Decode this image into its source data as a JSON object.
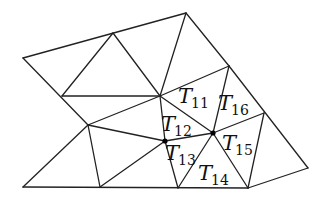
{
  "diagram": {
    "type": "triangulation-mesh",
    "line_color": "#222222",
    "vertices": {
      "A": [
        23,
        58
      ],
      "B": [
        113,
        33
      ],
      "C": [
        186,
        13
      ],
      "E": [
        62,
        96
      ],
      "D": [
        160,
        96
      ],
      "F": [
        229,
        66
      ],
      "G": [
        88,
        125
      ],
      "H": [
        165,
        141
      ],
      "I": [
        213,
        133
      ],
      "O": [
        264,
        113
      ],
      "J": [
        23,
        187
      ],
      "K": [
        100,
        187
      ],
      "L": [
        178,
        188
      ],
      "M": [
        248,
        188
      ],
      "N": [
        308,
        168
      ]
    },
    "edges": [
      [
        "A",
        "C"
      ],
      [
        "A",
        "G"
      ],
      [
        "B",
        "E"
      ],
      [
        "B",
        "D"
      ],
      [
        "C",
        "D"
      ],
      [
        "C",
        "F"
      ],
      [
        "F",
        "N"
      ],
      [
        "E",
        "D"
      ],
      [
        "D",
        "G"
      ],
      [
        "D",
        "H"
      ],
      [
        "D",
        "I"
      ],
      [
        "D",
        "F"
      ],
      [
        "F",
        "I"
      ],
      [
        "G",
        "J"
      ],
      [
        "G",
        "K"
      ],
      [
        "G",
        "H"
      ],
      [
        "H",
        "I"
      ],
      [
        "H",
        "K"
      ],
      [
        "H",
        "L"
      ],
      [
        "I",
        "L"
      ],
      [
        "I",
        "M"
      ],
      [
        "I",
        "O"
      ],
      [
        "O",
        "M"
      ],
      [
        "M",
        "N"
      ],
      [
        "J",
        "M"
      ]
    ],
    "dots": [
      "H",
      "I"
    ],
    "labels": [
      {
        "letter": "T",
        "index": "11",
        "x": 178,
        "y": 103
      },
      {
        "letter": "T",
        "index": "16",
        "x": 218,
        "y": 110
      },
      {
        "letter": "T",
        "index": "12",
        "x": 161,
        "y": 131
      },
      {
        "letter": "T",
        "index": "15",
        "x": 222,
        "y": 150
      },
      {
        "letter": "T",
        "index": "13",
        "x": 165,
        "y": 160
      },
      {
        "letter": "T",
        "index": "14",
        "x": 198,
        "y": 180
      }
    ]
  }
}
